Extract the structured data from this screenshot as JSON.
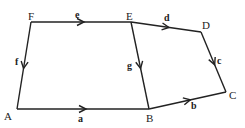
{
  "diagram": {
    "type": "directed-graph",
    "nodes": [
      {
        "id": "A",
        "label": "A",
        "x": 17,
        "y": 109,
        "lx": 4,
        "ly": 111
      },
      {
        "id": "B",
        "label": "B",
        "x": 149,
        "y": 109,
        "lx": 146,
        "ly": 113
      },
      {
        "id": "C",
        "label": "C",
        "x": 226,
        "y": 92,
        "lx": 229,
        "ly": 90
      },
      {
        "id": "D",
        "label": "D",
        "x": 201,
        "y": 32,
        "lx": 202,
        "ly": 20
      },
      {
        "id": "E",
        "label": "E",
        "x": 131,
        "y": 22,
        "lx": 126,
        "ly": 11
      },
      {
        "id": "F",
        "label": "F",
        "x": 31,
        "y": 22,
        "lx": 28,
        "ly": 11
      }
    ],
    "edges": [
      {
        "id": "a",
        "label": "a",
        "from": "A",
        "to": "B",
        "lx": 78,
        "ly": 114
      },
      {
        "id": "b",
        "label": "b",
        "from": "B",
        "to": "C",
        "lx": 191,
        "ly": 101
      },
      {
        "id": "c",
        "label": "c",
        "from": "D",
        "to": "C",
        "lx": 217,
        "ly": 56
      },
      {
        "id": "d",
        "label": "d",
        "from": "E",
        "to": "D",
        "lx": 164,
        "ly": 13
      },
      {
        "id": "e",
        "label": "e",
        "from": "F",
        "to": "E",
        "lx": 75,
        "ly": 10
      },
      {
        "id": "f",
        "label": "f",
        "from": "F",
        "to": "A",
        "lx": 15,
        "ly": 57
      },
      {
        "id": "g",
        "label": "g",
        "from": "E",
        "to": "B",
        "lx": 127,
        "ly": 61
      }
    ]
  }
}
